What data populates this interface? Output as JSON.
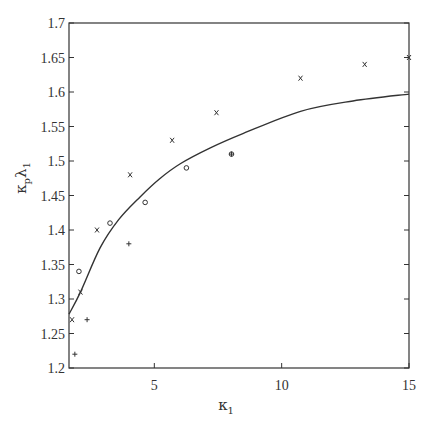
{
  "chart_data": {
    "type": "scatter",
    "title": "",
    "xlabel": "κ_1",
    "xlabel_main": "κ",
    "xlabel_sub": "1",
    "ylabel": "κ_p λ_1",
    "ylabel_main1": "κ",
    "ylabel_sub1": "p",
    "ylabel_main2": "λ",
    "ylabel_sub2": "1",
    "xlim": [
      1.65,
      15
    ],
    "ylim": [
      1.2,
      1.7
    ],
    "grid": false,
    "legend": null,
    "x_ticks": [
      5,
      10,
      15
    ],
    "x_tick_labels": [
      "5",
      "10",
      "15"
    ],
    "y_ticks": [
      1.2,
      1.25,
      1.3,
      1.35,
      1.4,
      1.45,
      1.5,
      1.55,
      1.6,
      1.65,
      1.7
    ],
    "y_tick_labels": [
      "1.2",
      "1.25",
      "1.3",
      "1.35",
      "1.4",
      "1.45",
      "1.5",
      "1.55",
      "1.6",
      "1.65",
      "1.7"
    ],
    "series": [
      {
        "name": "x markers",
        "marker": "x",
        "points": [
          {
            "x": 1.77,
            "y": 1.27
          },
          {
            "x": 2.1,
            "y": 1.31
          },
          {
            "x": 2.75,
            "y": 1.4
          },
          {
            "x": 4.05,
            "y": 1.48
          },
          {
            "x": 5.7,
            "y": 1.53
          },
          {
            "x": 7.44,
            "y": 1.57
          },
          {
            "x": 10.74,
            "y": 1.62
          },
          {
            "x": 13.26,
            "y": 1.64
          },
          {
            "x": 15.0,
            "y": 1.65
          }
        ]
      },
      {
        "name": "o markers",
        "marker": "o",
        "points": [
          {
            "x": 2.04,
            "y": 1.34
          },
          {
            "x": 3.26,
            "y": 1.41
          },
          {
            "x": 4.64,
            "y": 1.44
          },
          {
            "x": 6.26,
            "y": 1.49
          },
          {
            "x": 8.03,
            "y": 1.51
          }
        ]
      },
      {
        "name": "+ markers",
        "marker": "+",
        "points": [
          {
            "x": 1.88,
            "y": 1.22
          },
          {
            "x": 2.36,
            "y": 1.27
          },
          {
            "x": 4.0,
            "y": 1.38
          },
          {
            "x": 8.03,
            "y": 1.51
          }
        ]
      },
      {
        "name": "theoretical curve",
        "marker": "line",
        "points": [
          {
            "x": 1.65,
            "y": 1.278
          },
          {
            "x": 2.1,
            "y": 1.31
          },
          {
            "x": 2.87,
            "y": 1.374
          },
          {
            "x": 3.6,
            "y": 1.415
          },
          {
            "x": 4.44,
            "y": 1.448
          },
          {
            "x": 5.2,
            "y": 1.474
          },
          {
            "x": 6.02,
            "y": 1.496
          },
          {
            "x": 7.2,
            "y": 1.519
          },
          {
            "x": 8.5,
            "y": 1.54
          },
          {
            "x": 10.74,
            "y": 1.572
          },
          {
            "x": 12.8,
            "y": 1.587
          },
          {
            "x": 15.0,
            "y": 1.597
          }
        ]
      }
    ]
  },
  "layout": {
    "plot_left": 69,
    "plot_right": 409,
    "plot_top": 23,
    "plot_bottom": 368,
    "line_color": "#333333",
    "marker_color": "#333333"
  }
}
